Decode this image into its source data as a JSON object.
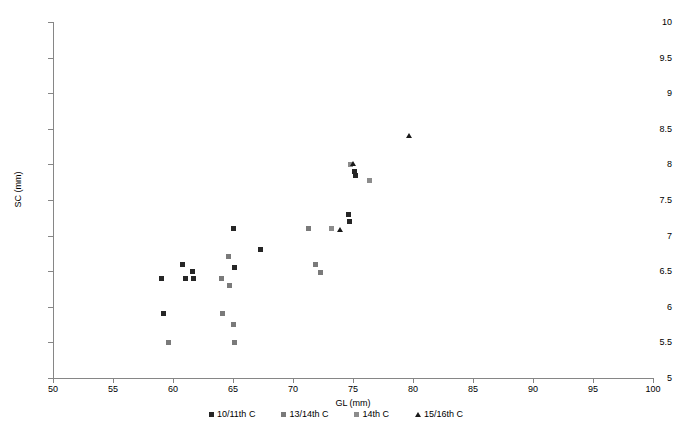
{
  "chart_data": {
    "type": "scatter",
    "title": "",
    "xlabel": "GL (mm)",
    "ylabel": "SC (mm)",
    "xlim": [
      50,
      100
    ],
    "ylim": [
      5,
      10
    ],
    "xticks": [
      50,
      55,
      60,
      65,
      70,
      75,
      80,
      85,
      90,
      95,
      100
    ],
    "yticks": [
      5,
      5.5,
      6,
      6.5,
      7,
      7.5,
      8,
      8.5,
      9,
      9.5,
      10
    ],
    "grid": false,
    "legend_position": "bottom",
    "series": [
      {
        "name": "10/11th C",
        "marker": "square",
        "color": "#262626",
        "points": [
          [
            59.0,
            6.4
          ],
          [
            59.2,
            5.9
          ],
          [
            60.8,
            6.6
          ],
          [
            61.0,
            6.4
          ],
          [
            61.6,
            6.5
          ],
          [
            61.7,
            6.4
          ],
          [
            65.0,
            7.1
          ],
          [
            65.1,
            6.55
          ],
          [
            67.3,
            6.8
          ],
          [
            74.6,
            7.3
          ],
          [
            74.7,
            7.2
          ],
          [
            75.1,
            7.9
          ],
          [
            75.2,
            7.85
          ]
        ]
      },
      {
        "name": "13/14th C",
        "marker": "square",
        "color": "#7a7a7a",
        "points": [
          [
            59.6,
            5.5
          ],
          [
            64.0,
            6.4
          ],
          [
            64.1,
            5.9
          ],
          [
            64.6,
            6.7
          ],
          [
            64.7,
            6.3
          ],
          [
            65.0,
            5.75
          ],
          [
            65.1,
            5.5
          ],
          [
            71.3,
            7.1
          ],
          [
            71.9,
            6.6
          ],
          [
            72.3,
            6.48
          ]
        ]
      },
      {
        "name": "14th C",
        "marker": "square",
        "color": "#8c8c8c",
        "points": [
          [
            73.2,
            7.1
          ],
          [
            74.8,
            8.0
          ],
          [
            76.4,
            7.78
          ]
        ]
      },
      {
        "name": "15/16th C",
        "marker": "triangle",
        "color": "#1a1a1a",
        "points": [
          [
            73.9,
            7.08
          ],
          [
            75.0,
            8.0
          ],
          [
            79.7,
            8.4
          ]
        ]
      }
    ]
  },
  "axes": {
    "y_title": "SC (mm)",
    "x_title": "GL (mm)",
    "y_tick_labels": [
      "10",
      "9.5",
      "9",
      "8.5",
      "8",
      "7.5",
      "7",
      "6.5",
      "6",
      "5.5",
      "5"
    ],
    "x_tick_labels": [
      "50",
      "55",
      "60",
      "65",
      "70",
      "75",
      "80",
      "85",
      "90",
      "95",
      "100"
    ]
  },
  "legend": {
    "items": [
      {
        "label": "10/11th C",
        "marker": "square",
        "color": "#262626"
      },
      {
        "label": "13/14th C",
        "marker": "square",
        "color": "#7a7a7a"
      },
      {
        "label": "14th C",
        "marker": "square",
        "color": "#8c8c8c"
      },
      {
        "label": "15/16th C",
        "marker": "triangle",
        "color": "#1a1a1a"
      }
    ]
  }
}
